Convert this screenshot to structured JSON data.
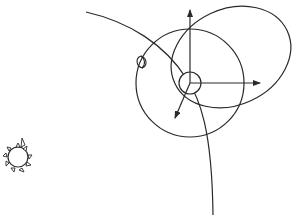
{
  "diagram": {
    "title": "",
    "stroke_color": "#2a2a2a",
    "background": "#ffffff",
    "elements": {
      "sun": {
        "label": "sun-icon",
        "cx": 18,
        "cy": 157,
        "r": 10
      },
      "moon": {
        "label": "moon-crescent-icon",
        "cx": 142,
        "cy": 62
      },
      "center_body": {
        "label": "central-body",
        "cx": 190,
        "cy": 83,
        "r": 11
      },
      "large_orbit": {
        "label": "circular-orbit",
        "cx": 190,
        "cy": 83,
        "r": 54
      },
      "ellipse_orbit": {
        "label": "elliptical-orbit",
        "cx": 231,
        "cy": 57,
        "rx": 62,
        "ry": 48,
        "rotation": -25
      },
      "trajectory": {
        "label": "trajectory-curve"
      },
      "axes": [
        {
          "label": "axis-up",
          "x2": 190,
          "y2": 10
        },
        {
          "label": "axis-right",
          "x2": 260,
          "y2": 83
        },
        {
          "label": "axis-down-left",
          "x2": 175,
          "y2": 118
        }
      ]
    }
  }
}
